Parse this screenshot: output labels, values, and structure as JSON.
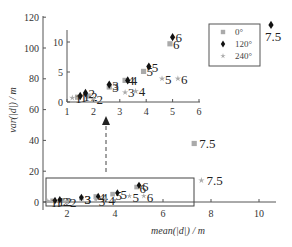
{
  "chart_data": {
    "type": "scatter",
    "title": "",
    "xlabel": "mean(|d|) / m",
    "ylabel": "var(|d|) / m",
    "xlim": [
      1,
      11
    ],
    "ylim": [
      -5,
      120
    ],
    "x_ticks": [
      "2",
      "4",
      "6",
      "8",
      "10"
    ],
    "y_ticks": [
      "0",
      "20",
      "40",
      "60",
      "80",
      "100",
      "120"
    ],
    "grid": false,
    "legend_position": "upper right",
    "legend": [
      "0°",
      "120°",
      "240°"
    ],
    "series": [
      {
        "name": "0°",
        "marker": "square",
        "color": "#aaaaaa",
        "points": [
          {
            "label": "1",
            "x": 1.4,
            "y": 0.8
          },
          {
            "label": "2",
            "x": 1.8,
            "y": 1.0
          },
          {
            "label": "3",
            "x": 2.6,
            "y": 2.5
          },
          {
            "label": "4",
            "x": 3.2,
            "y": 3.6
          },
          {
            "label": "5",
            "x": 3.9,
            "y": 5.1
          },
          {
            "label": "6",
            "x": 4.9,
            "y": 9.7
          },
          {
            "label": "7.5",
            "x": 7.3,
            "y": 38
          }
        ]
      },
      {
        "name": "120°",
        "marker": "diamond",
        "color": "#111111",
        "points": [
          {
            "label": "1",
            "x": 1.5,
            "y": 1.0
          },
          {
            "label": "2",
            "x": 1.7,
            "y": 1.5
          },
          {
            "label": "3",
            "x": 2.6,
            "y": 2.9
          },
          {
            "label": "4",
            "x": 3.3,
            "y": 3.6
          },
          {
            "label": "5",
            "x": 4.1,
            "y": 5.9
          },
          {
            "label": "6",
            "x": 5.0,
            "y": 10.8
          },
          {
            "label": "7.5",
            "x": 10.5,
            "y": 115
          }
        ]
      },
      {
        "name": "240°",
        "marker": "star",
        "color": "#aaaaaa",
        "points": [
          {
            "label": "1",
            "x": 1.2,
            "y": 0.7
          },
          {
            "label": "2",
            "x": 2.0,
            "y": 0.5
          },
          {
            "label": "3",
            "x": 3.2,
            "y": 1.6
          },
          {
            "label": "4",
            "x": 3.6,
            "y": 1.8
          },
          {
            "label": "5",
            "x": 4.6,
            "y": 3.9
          },
          {
            "label": "6",
            "x": 5.2,
            "y": 3.9
          },
          {
            "label": "7.5",
            "x": 7.6,
            "y": 14
          }
        ]
      }
    ],
    "inset": {
      "xlim": [
        1,
        6
      ],
      "ylim": [
        0,
        12
      ],
      "x_ticks": [
        "1",
        "2",
        "3",
        "4",
        "5",
        "6"
      ],
      "y_ticks": [
        "0",
        "5",
        "10"
      ],
      "note": "Zoomed view of the boxed region near the origin (x 1–6, y 0–12), linked by a dashed arrow."
    }
  }
}
